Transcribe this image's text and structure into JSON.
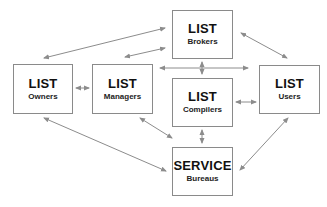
{
  "diagram": {
    "nodes": [
      {
        "id": "owners",
        "title": "LIST",
        "subtitle": "Owners"
      },
      {
        "id": "managers",
        "title": "LIST",
        "subtitle": "Managers"
      },
      {
        "id": "brokers",
        "title": "LIST",
        "subtitle": "Brokers"
      },
      {
        "id": "compilers",
        "title": "LIST",
        "subtitle": "Compilers"
      },
      {
        "id": "users",
        "title": "LIST",
        "subtitle": "Users"
      },
      {
        "id": "bureaus",
        "title": "SERVICE",
        "subtitle": "Bureaus"
      }
    ],
    "edges": [
      {
        "from": "owners",
        "to": "brokers",
        "type": "bidirectional"
      },
      {
        "from": "owners",
        "to": "managers",
        "type": "bidirectional"
      },
      {
        "from": "owners",
        "to": "bureaus",
        "type": "bidirectional"
      },
      {
        "from": "managers",
        "to": "brokers",
        "type": "bidirectional"
      },
      {
        "from": "managers",
        "to": "users",
        "type": "bidirectional"
      },
      {
        "from": "managers",
        "to": "bureaus",
        "type": "bidirectional"
      },
      {
        "from": "brokers",
        "to": "compilers",
        "type": "bidirectional"
      },
      {
        "from": "brokers",
        "to": "users",
        "type": "bidirectional"
      },
      {
        "from": "compilers",
        "to": "users",
        "type": "bidirectional"
      },
      {
        "from": "compilers",
        "to": "bureaus",
        "type": "bidirectional"
      },
      {
        "from": "users",
        "to": "bureaus",
        "type": "bidirectional"
      }
    ],
    "colors": {
      "arrow": "#8c8c8c",
      "border": "#8a8a8a",
      "text": "#111111"
    }
  }
}
